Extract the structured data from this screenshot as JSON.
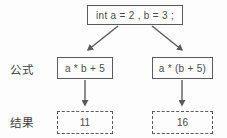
{
  "diagram": {
    "type": "flow-diagram",
    "background_color": "#fdfdfd",
    "stroke_color": "#5a5a5a",
    "text_color": "#4a4a4a",
    "declaration": {
      "text": "int a = 2 , b = 3 ;",
      "border_style": "solid"
    },
    "row_labels": {
      "formula": "公式",
      "result": "结果"
    },
    "branches": [
      {
        "formula": "a * b + 5",
        "formula_border_style": "solid",
        "result": "11",
        "result_border_style": "dashed"
      },
      {
        "formula": "a * (b + 5)",
        "formula_border_style": "solid",
        "result": "16",
        "result_border_style": "dashed"
      }
    ],
    "connectors": [
      {
        "name": "decl-to-left-formula",
        "style": "solid-arrow",
        "direction": "down-left"
      },
      {
        "name": "decl-to-right-formula",
        "style": "solid-arrow",
        "direction": "down-right"
      },
      {
        "name": "left-formula-to-left-result",
        "style": "solid-arrow",
        "direction": "down"
      },
      {
        "name": "right-formula-to-right-result",
        "style": "solid-arrow",
        "direction": "down"
      }
    ]
  }
}
